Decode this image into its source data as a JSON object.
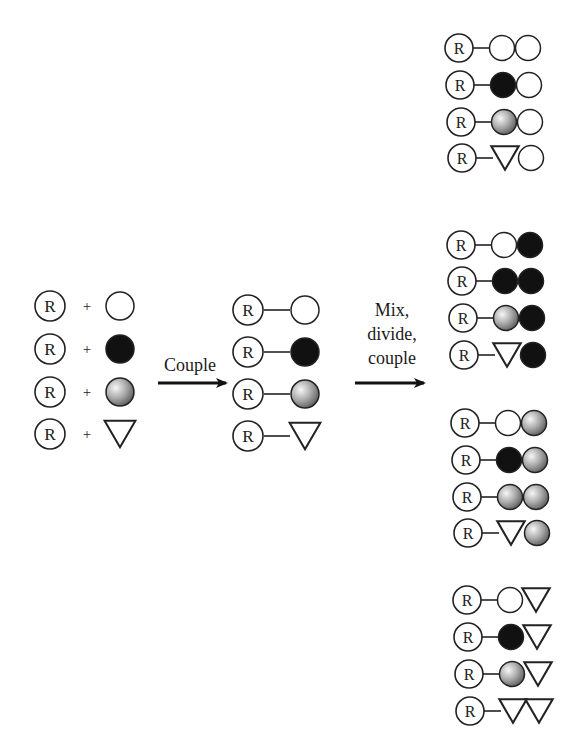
{
  "diagram": {
    "type": "split-and-pool combinatorial synthesis",
    "resin_label": "R",
    "monomers": [
      {
        "id": "white",
        "shape": "circle",
        "fill": "#ffffff"
      },
      {
        "id": "black",
        "shape": "circle",
        "fill": "#111111"
      },
      {
        "id": "gray",
        "shape": "circle",
        "fill": "gradient"
      },
      {
        "id": "triangle",
        "shape": "triangle",
        "fill": "#ffffff"
      }
    ],
    "plus_sign": "+",
    "step1_label": "Couple",
    "step2_label_lines": [
      "Mix,",
      "divide,",
      "couple"
    ],
    "reactants": [
      {
        "resin": "R",
        "monomer": "white"
      },
      {
        "resin": "R",
        "monomer": "black"
      },
      {
        "resin": "R",
        "monomer": "gray"
      },
      {
        "resin": "R",
        "monomer": "triangle"
      }
    ],
    "intermediates": [
      [
        "white"
      ],
      [
        "black"
      ],
      [
        "gray"
      ],
      [
        "triangle"
      ]
    ],
    "products": [
      {
        "group": 1,
        "second": "white",
        "items": [
          [
            "white",
            "white"
          ],
          [
            "black",
            "white"
          ],
          [
            "gray",
            "white"
          ],
          [
            "triangle",
            "white"
          ]
        ]
      },
      {
        "group": 2,
        "second": "black",
        "items": [
          [
            "white",
            "black"
          ],
          [
            "black",
            "black"
          ],
          [
            "gray",
            "black"
          ],
          [
            "triangle",
            "black"
          ]
        ]
      },
      {
        "group": 3,
        "second": "gray",
        "items": [
          [
            "white",
            "gray"
          ],
          [
            "black",
            "gray"
          ],
          [
            "gray",
            "gray"
          ],
          [
            "triangle",
            "gray"
          ]
        ]
      },
      {
        "group": 4,
        "second": "triangle",
        "items": [
          [
            "white",
            "triangle"
          ],
          [
            "black",
            "triangle"
          ],
          [
            "gray",
            "triangle"
          ],
          [
            "triangle",
            "triangle"
          ]
        ]
      }
    ],
    "colors": {
      "stroke": "#222222",
      "black_fill": "#111111",
      "gray_light": "#f2f2f2",
      "gray_dark": "#7a7a7a",
      "arrow": "#111111"
    }
  }
}
